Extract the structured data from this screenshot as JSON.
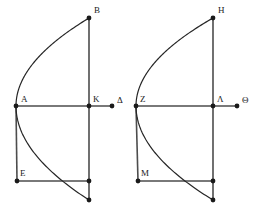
{
  "figure": {
    "title": "",
    "background_color": "#ffffff",
    "stroke_color": "#4d4d4d",
    "curve_color": "#262626",
    "point_color": "#1a1a1a",
    "label_color": "#1a1a1a",
    "point_radius": 2.4,
    "line_width": 1.6,
    "curve_width": 1.2,
    "panels": [
      {
        "name": "left-figure",
        "labels": {
          "vertex": "A",
          "top": "B",
          "axis_mid": "K",
          "axis_end": "Δ",
          "lower_left": "E"
        },
        "points": {
          "vertex": [
            16,
            106
          ],
          "top": [
            89,
            18
          ],
          "axis_mid": [
            89,
            106
          ],
          "axis_end": [
            112,
            106
          ],
          "lower_left": [
            17,
            181
          ],
          "lower_mid": [
            89,
            181
          ],
          "bottom": [
            89,
            200
          ]
        },
        "label_offsets": {
          "vertex": [
            5,
            -4
          ],
          "top": [
            5,
            -5
          ],
          "axis_mid": [
            4,
            -4
          ],
          "axis_end": [
            5,
            -3
          ],
          "lower_left": [
            3,
            -5
          ]
        }
      },
      {
        "name": "right-figure",
        "labels": {
          "vertex": "Z",
          "top": "H",
          "axis_mid": "Λ",
          "axis_end": "Θ",
          "lower_left": "M"
        },
        "points": {
          "vertex": [
            136,
            106
          ],
          "top": [
            213,
            18
          ],
          "axis_mid": [
            213,
            106
          ],
          "axis_end": [
            237,
            106
          ],
          "lower_left": [
            138,
            181
          ],
          "lower_mid": [
            213,
            181
          ],
          "bottom": [
            213,
            200
          ]
        },
        "label_offsets": {
          "vertex": [
            4,
            -4
          ],
          "top": [
            5,
            -5
          ],
          "axis_mid": [
            4,
            -4
          ],
          "axis_end": [
            5,
            -3
          ],
          "lower_left": [
            3,
            -5
          ]
        }
      }
    ],
    "segments": [
      {
        "name": "axis-line",
        "from": "vertex",
        "to": "axis_end"
      },
      {
        "name": "vertical-chord-upper",
        "from": "top",
        "to": "axis_mid"
      },
      {
        "name": "vertical-chord-lower",
        "from": "axis_mid",
        "to": "bottom"
      },
      {
        "name": "left-vertical",
        "from": "vertex",
        "to": "lower_left"
      },
      {
        "name": "lower-horizontal",
        "from": "lower_left",
        "to": "lower_mid"
      }
    ],
    "curve": {
      "name": "parabola",
      "description": "parabola with vertex at left point opening rightward through top point and bottom point"
    }
  }
}
